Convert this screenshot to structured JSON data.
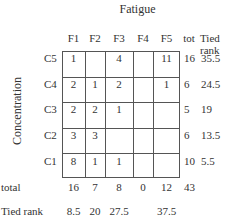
{
  "title": "Fatigue",
  "ylabel": "Concentration",
  "columns": [
    "F1",
    "F2",
    "F3",
    "F4",
    "F5"
  ],
  "tot_label": "tot",
  "tied_rank_label_line1": "Tied",
  "tied_rank_label_line2": "rank",
  "rows": [
    {
      "label": "C5",
      "cells": [
        "1",
        "",
        "4",
        "",
        "11"
      ],
      "tot": "16",
      "rank": "35.5"
    },
    {
      "label": "C4",
      "cells": [
        "2",
        "1",
        "2",
        "",
        "1"
      ],
      "tot": "6",
      "rank": "24.5"
    },
    {
      "label": "C3",
      "cells": [
        "2",
        "2",
        "1",
        "",
        ""
      ],
      "tot": "5",
      "rank": "19"
    },
    {
      "label": "C2",
      "cells": [
        "3",
        "3",
        "",
        "",
        ""
      ],
      "tot": "6",
      "rank": "13.5"
    },
    {
      "label": "C1",
      "cells": [
        "8",
        "1",
        "1",
        "",
        ""
      ],
      "tot": "10",
      "rank": "5.5"
    }
  ],
  "total_label": "total",
  "totals": [
    "16",
    "7",
    "8",
    "0",
    "12"
  ],
  "grand_total": "43",
  "tied_rank_row_label": "Tied rank",
  "col_ranks": [
    "8.5",
    "20",
    "27.5",
    "",
    "37.5"
  ]
}
